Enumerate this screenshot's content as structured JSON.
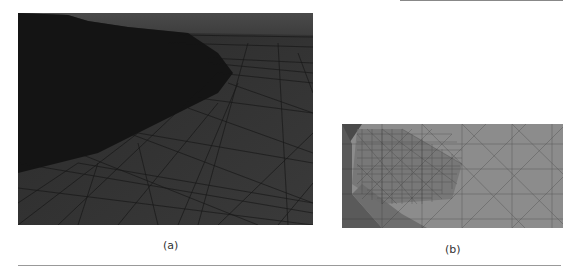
{
  "figure": {
    "panels": [
      {
        "id": "a",
        "caption": "(a)",
        "description": "Perspective wireframe terrain render with triangulated mesh over dark hillside and sky"
      },
      {
        "id": "b",
        "caption": "(b)",
        "description": "Top-down adaptive triangle mesh with dense refinement in upper-left region"
      }
    ]
  }
}
